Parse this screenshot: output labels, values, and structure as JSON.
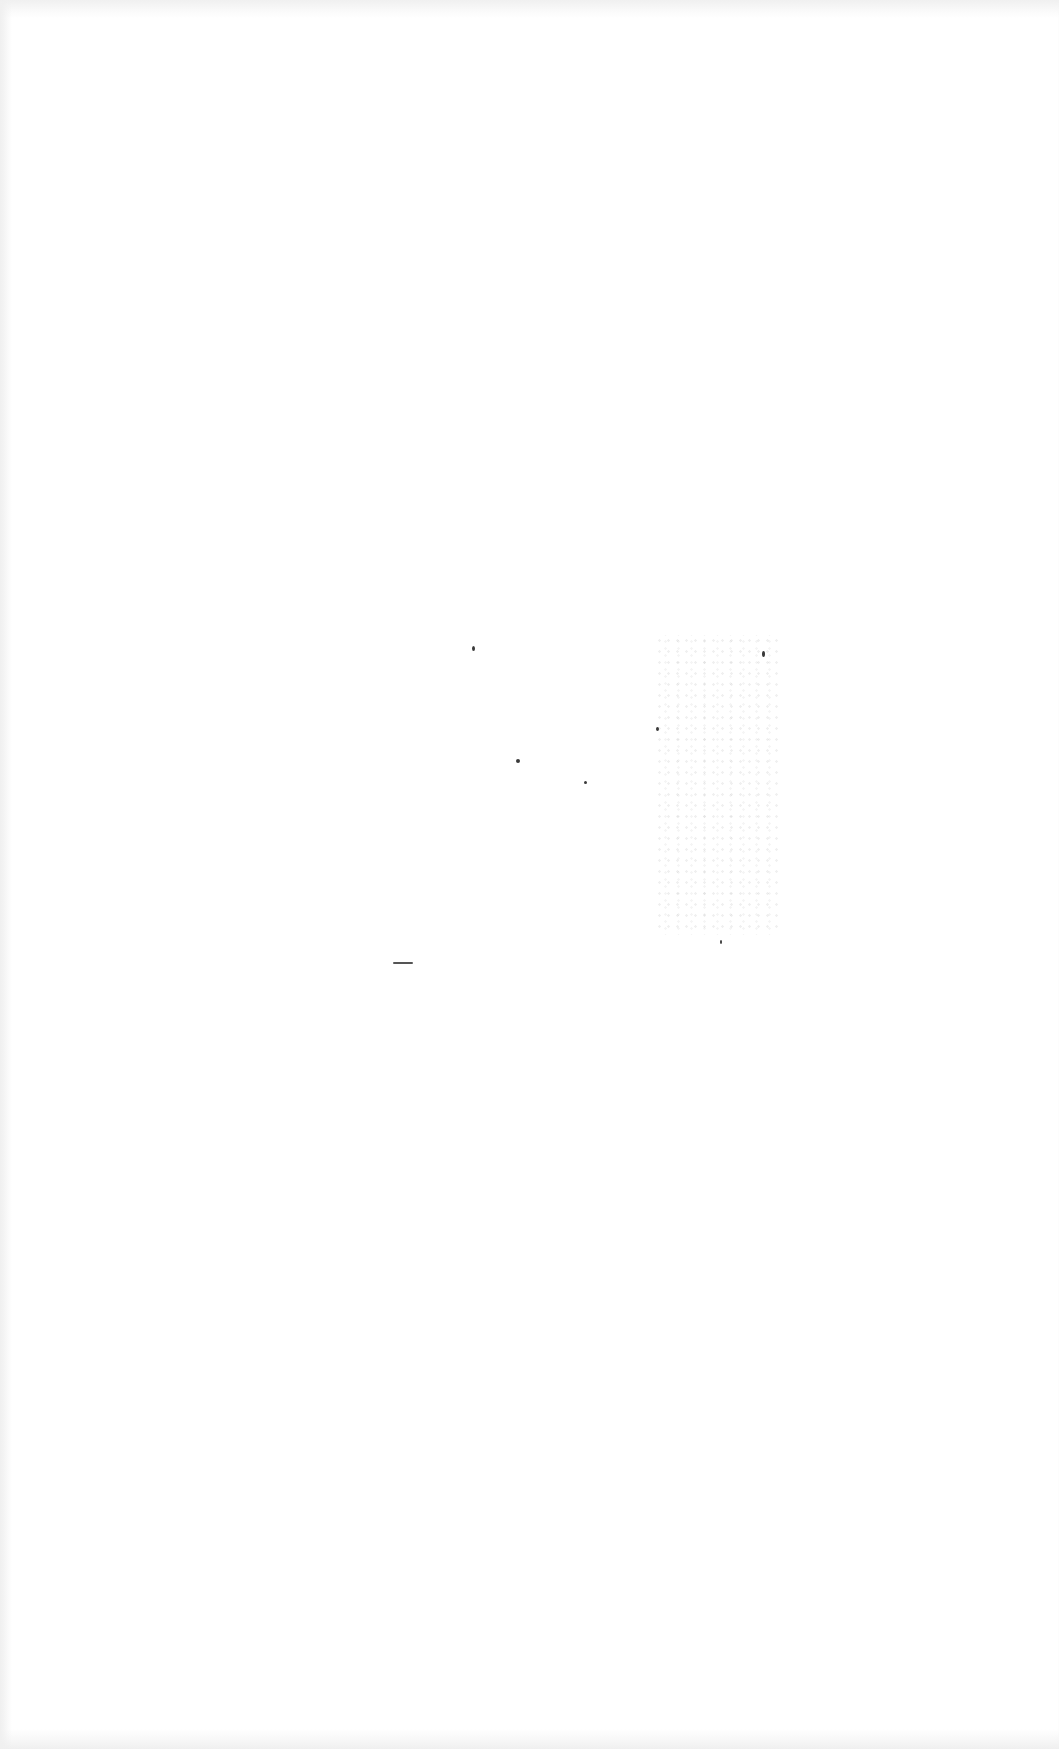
{
  "document": {
    "type": "blank scanned page",
    "text_content": "",
    "background_color": "#ffffff"
  },
  "artifacts": {
    "noise_patch": {
      "x": 655,
      "y": 635,
      "w": 125,
      "h": 300
    },
    "specks": [
      {
        "x": 472,
        "y": 646,
        "w": 3,
        "h": 5
      },
      {
        "x": 516,
        "y": 759,
        "w": 4,
        "h": 4
      },
      {
        "x": 584,
        "y": 781,
        "w": 3,
        "h": 3
      },
      {
        "x": 656,
        "y": 727,
        "w": 3,
        "h": 4
      },
      {
        "x": 762,
        "y": 651,
        "w": 3,
        "h": 6
      },
      {
        "x": 720,
        "y": 940,
        "w": 2,
        "h": 4
      }
    ],
    "dash": {
      "x": 393,
      "y": 962,
      "w": 20
    }
  }
}
